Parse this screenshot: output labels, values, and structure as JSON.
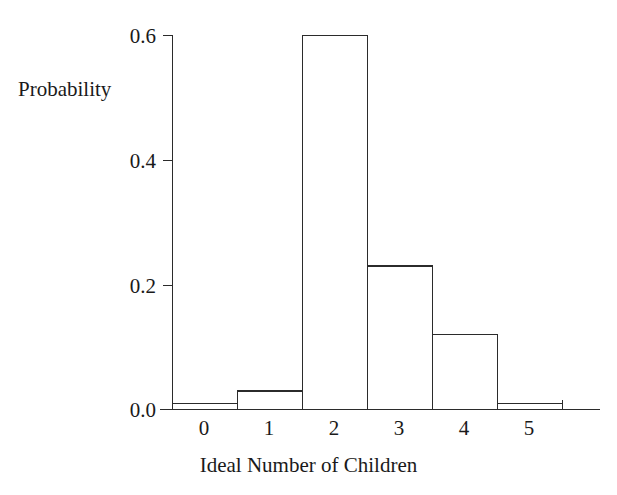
{
  "chart_data": {
    "type": "bar",
    "title": "",
    "xlabel": "Ideal Number of Children",
    "ylabel": "Probability",
    "categories": [
      "0",
      "1",
      "2",
      "3",
      "4",
      "5"
    ],
    "values": [
      0.01,
      0.03,
      0.6,
      0.23,
      0.12,
      0.01
    ],
    "series": [
      {
        "name": "Probability",
        "values": [
          0.01,
          0.03,
          0.6,
          0.23,
          0.12,
          0.01
        ]
      }
    ],
    "xlim": [
      -0.5,
      5.5
    ],
    "ylim": [
      0.0,
      0.6
    ],
    "yticks": [
      "0.0",
      "0.2",
      "0.4",
      "0.6"
    ],
    "ytick_values": [
      0.0,
      0.2,
      0.4,
      0.6
    ],
    "xticks": [
      "0",
      "1",
      "2",
      "3",
      "4",
      "5"
    ],
    "grid": false,
    "legend": false,
    "bar_style": "outline-only",
    "colors": {
      "background": "#ffffff",
      "axis": "#2b2b2b",
      "bar_edge": "#2b2b2b",
      "bar_fill": "none",
      "text": "#1a1a1a"
    }
  }
}
